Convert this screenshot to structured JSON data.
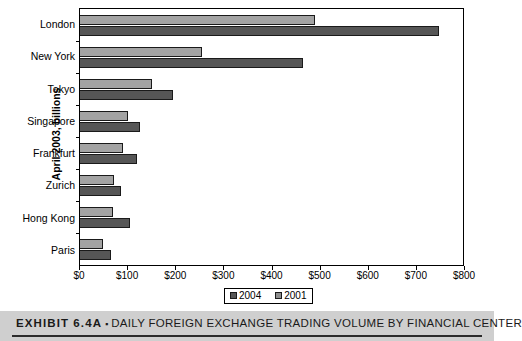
{
  "chart_data": {
    "type": "bar",
    "orientation": "horizontal",
    "title": "",
    "xlabel": "",
    "ylabel": "April 2003, billions",
    "categories": [
      "London",
      "New York",
      "Tokyo",
      "Singapore",
      "Frankfurt",
      "Zurich",
      "Hong Kong",
      "Paris"
    ],
    "series": [
      {
        "name": "2001",
        "color": "#a3a3a3",
        "values": [
          490,
          255,
          150,
          100,
          90,
          70,
          68,
          48
        ]
      },
      {
        "name": "2004",
        "color": "#565656",
        "values": [
          750,
          465,
          195,
          125,
          120,
          85,
          105,
          65
        ]
      }
    ],
    "xlim": [
      0,
      800
    ],
    "xticks": [
      0,
      100,
      200,
      300,
      400,
      500,
      600,
      700,
      800
    ],
    "xtick_labels": [
      "$0",
      "$100",
      "$200",
      "$300",
      "$400",
      "$500",
      "$600",
      "$700",
      "$800"
    ],
    "grid": false,
    "legend_position": "bottom-center",
    "legend_entries": [
      "2004",
      "2001"
    ]
  },
  "axis": {
    "y_title": "April 2003, billions"
  },
  "legend": {
    "items": [
      {
        "label": "2004",
        "swatch": "dark-gray-square-icon"
      },
      {
        "label": "2001",
        "swatch": "light-gray-square-icon"
      }
    ]
  },
  "caption": {
    "exhibit_number": "EXHIBIT 6.4A",
    "separator": "▪",
    "title": "DAILY FOREIGN EXCHANGE TRADING VOLUME BY FINANCIAL CENTER"
  }
}
